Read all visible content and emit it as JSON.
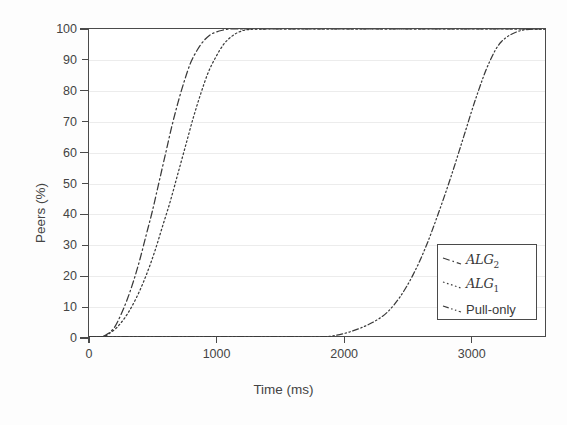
{
  "chart_data": {
    "type": "line",
    "title": "",
    "xlabel": "Time (ms)",
    "ylabel": "Peers (%)",
    "xlim": [
      0,
      3590
    ],
    "ylim": [
      0,
      100
    ],
    "xticks": [
      0,
      1000,
      2000,
      3000
    ],
    "xticklabels": [
      "0",
      "1000",
      "2000",
      "3000"
    ],
    "yticks": [
      0,
      10,
      20,
      30,
      40,
      50,
      60,
      70,
      80,
      90,
      100
    ],
    "yticklabels": [
      "0",
      "10",
      "20",
      "30",
      "40",
      "50",
      "60",
      "70",
      "80",
      "90",
      "100"
    ],
    "grid": "horizontal",
    "legend_position": "center-right",
    "series": [
      {
        "name": "ALG2",
        "label_base": "ALG",
        "label_sub": "2",
        "linestyle": "dash-dot",
        "color": "#3a3a3a",
        "x": [
          0,
          100,
          150,
          200,
          250,
          300,
          350,
          400,
          450,
          500,
          550,
          600,
          650,
          700,
          750,
          800,
          850,
          900,
          950,
          1000,
          1050,
          1100,
          1150,
          1250,
          1600,
          2000,
          2500,
          3000,
          3590
        ],
        "y": [
          0,
          0,
          1,
          3,
          7,
          12,
          18,
          25,
          33,
          41,
          50,
          59,
          68,
          76,
          83,
          89,
          93,
          96,
          98,
          99,
          99.6,
          100,
          100,
          100,
          100,
          100,
          100,
          100,
          100
        ]
      },
      {
        "name": "ALG1",
        "label_base": "ALG",
        "label_sub": "1",
        "linestyle": "dotted",
        "color": "#3a3a3a",
        "x": [
          0,
          110,
          160,
          220,
          280,
          340,
          400,
          460,
          520,
          580,
          640,
          700,
          760,
          820,
          880,
          940,
          1000,
          1060,
          1120,
          1180,
          1250,
          1400,
          1800,
          2200,
          2800,
          3200,
          3590
        ],
        "y": [
          0,
          0,
          1,
          3,
          6,
          10,
          15,
          21,
          28,
          36,
          44,
          53,
          62,
          71,
          79,
          86,
          91,
          95,
          97.5,
          99,
          99.8,
          100,
          100,
          100,
          100,
          100,
          100
        ]
      },
      {
        "name": "Pull-only",
        "label_base": "Pull-only",
        "label_sub": "",
        "linestyle": "dash-dot-dot",
        "color": "#3a3a3a",
        "x": [
          0,
          500,
          1000,
          1500,
          1850,
          1950,
          2050,
          2150,
          2250,
          2350,
          2450,
          2550,
          2650,
          2750,
          2850,
          2950,
          3050,
          3150,
          3250,
          3400,
          3590
        ],
        "y": [
          0,
          0,
          0,
          0,
          0,
          0.5,
          1.5,
          3,
          5,
          8,
          13,
          20,
          29,
          40,
          52,
          65,
          78,
          89,
          96,
          99.5,
          100
        ]
      }
    ]
  },
  "legend": {
    "items": [
      {
        "label": "ALG",
        "sub": "2",
        "script": true
      },
      {
        "label": "ALG",
        "sub": "1",
        "script": true
      },
      {
        "label": "Pull-only",
        "sub": "",
        "script": false
      }
    ]
  }
}
